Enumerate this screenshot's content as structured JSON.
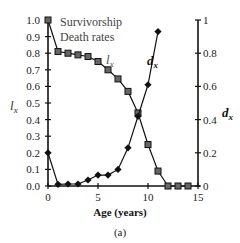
{
  "chart_data": {
    "type": "line",
    "title": "",
    "caption": "(a)",
    "xlabel": "Age (years)",
    "ylabel_left": "l_x",
    "ylabel_right": "d_x",
    "xlim": [
      0,
      15
    ],
    "ylim_left": [
      0,
      1.0
    ],
    "ylim_right": [
      0,
      1
    ],
    "x_ticks": [
      0,
      5,
      10,
      15
    ],
    "y_ticks_left": [
      "0.0",
      "0.1",
      "0.2",
      "0.3",
      "0.4",
      "0.5",
      "0.6",
      "0.7",
      "0.8",
      "0.9",
      "1.0"
    ],
    "y_ticks_right": [
      "0",
      "0.2",
      "0.4",
      "0.6",
      "0.8",
      "1"
    ],
    "grid": false,
    "legend": [
      "Survivorship",
      "Death rates"
    ],
    "legend_position": "top-left",
    "series": [
      {
        "name": "Survivorship",
        "label": "l_x",
        "marker": "square",
        "axis": "left",
        "x": [
          0,
          1,
          2,
          3,
          4,
          5,
          6,
          7,
          8,
          9,
          10,
          11,
          12,
          13,
          14
        ],
        "values": [
          1.0,
          0.81,
          0.8,
          0.79,
          0.78,
          0.75,
          0.7,
          0.645,
          0.57,
          0.44,
          0.25,
          0.09,
          0.0,
          0.0,
          0.0
        ]
      },
      {
        "name": "Death rates",
        "label": "d_x",
        "marker": "diamond",
        "axis": "right",
        "x": [
          0,
          1,
          2,
          3,
          4,
          5,
          6,
          7,
          8,
          9,
          10,
          11
        ],
        "values": [
          0.2,
          0.01,
          0.012,
          0.012,
          0.036,
          0.066,
          0.066,
          0.1,
          0.23,
          0.42,
          0.61,
          0.93
        ]
      }
    ]
  },
  "labels": {
    "legend_1": "Survivorship",
    "legend_2": "Death rates",
    "lx_main": "l",
    "lx_sub": "x",
    "dx_main": "d",
    "dx_sub": "x",
    "xlabel": "Age (years)",
    "caption": "(a)"
  }
}
